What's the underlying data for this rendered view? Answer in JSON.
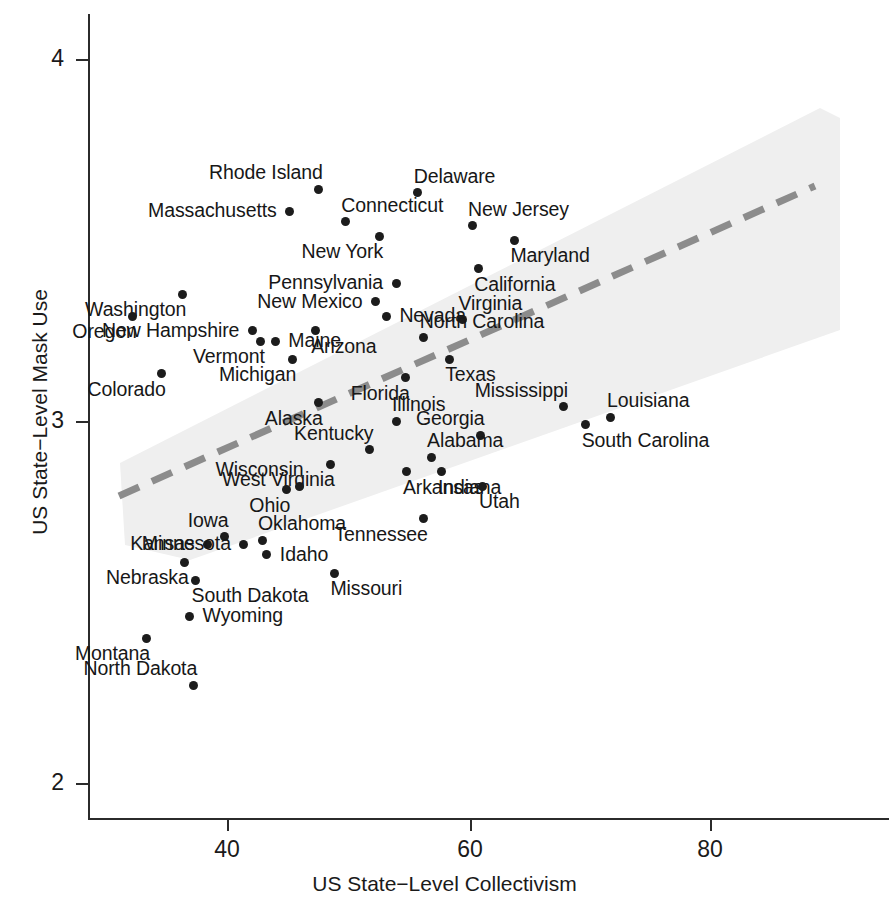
{
  "chart_data": {
    "type": "scatter",
    "title": "",
    "xlabel": "US State−Level Collectivism",
    "ylabel": "US State−Level Mask Use",
    "xlim": [
      30.5,
      91
    ],
    "ylim": [
      2.0,
      4.0
    ],
    "xticks": [
      40,
      60,
      80
    ],
    "xtick_labels": [
      "40",
      "60",
      "80"
    ],
    "yticks": [
      2,
      3,
      4
    ],
    "ytick_labels": [
      "2",
      "3",
      "4"
    ],
    "grid": false,
    "legend": null,
    "point_color": "#1c1c1c",
    "trend_line_color": "#8a8a8a",
    "band_color": "#eeeeee",
    "trend": {
      "type": "linear-fit-dashed",
      "x_start": 33.2,
      "y_start": 2.77,
      "x_end": 88.8,
      "y_end": 3.53,
      "confidence_band": true
    },
    "points": [
      {
        "label": "Rhode Island",
        "x": 47.6,
        "y": 3.64,
        "label_pos": "above-left"
      },
      {
        "label": "Delaware",
        "x": 55.8,
        "y": 3.63,
        "label_pos": "above-right"
      },
      {
        "label": "Massachusetts",
        "x": 45.2,
        "y": 3.58,
        "label_pos": "left"
      },
      {
        "label": "Connecticut",
        "x": 49.8,
        "y": 3.55,
        "label_pos": "above-right"
      },
      {
        "label": "New Jersey",
        "x": 60.3,
        "y": 3.54,
        "label_pos": "above-right"
      },
      {
        "label": "New York",
        "x": 52.6,
        "y": 3.51,
        "label_pos": "below-left"
      },
      {
        "label": "Maryland",
        "x": 63.8,
        "y": 3.5,
        "label_pos": "below-right"
      },
      {
        "label": "California",
        "x": 60.8,
        "y": 3.42,
        "label_pos": "below-right"
      },
      {
        "label": "Pennsylvania",
        "x": 54.0,
        "y": 3.38,
        "label_pos": "left"
      },
      {
        "label": "Washington",
        "x": 36.3,
        "y": 3.35,
        "label_pos": "below-left"
      },
      {
        "label": "New Mexico",
        "x": 52.3,
        "y": 3.33,
        "label_pos": "left"
      },
      {
        "label": "Oregon",
        "x": 32.2,
        "y": 3.29,
        "label_pos": "below-left"
      },
      {
        "label": "Nevada",
        "x": 53.2,
        "y": 3.29,
        "label_pos": "right"
      },
      {
        "label": "Virginia",
        "x": 59.5,
        "y": 3.28,
        "label_pos": "above-right"
      },
      {
        "label": "New Hampshire",
        "x": 42.1,
        "y": 3.25,
        "label_pos": "left"
      },
      {
        "label": "Arizona",
        "x": 47.3,
        "y": 3.25,
        "label_pos": "below-right"
      },
      {
        "label": "North Carolina",
        "x": 56.3,
        "y": 3.23,
        "label_pos": "above-right"
      },
      {
        "label": "Vermont",
        "x": 42.8,
        "y": 3.22,
        "label_pos": "below-left"
      },
      {
        "label": "Maine",
        "x": 44.0,
        "y": 3.22,
        "label_pos": "right"
      },
      {
        "label": "Texas",
        "x": 58.4,
        "y": 3.17,
        "label_pos": "below-right"
      },
      {
        "label": "Michigan",
        "x": 45.4,
        "y": 3.17,
        "label_pos": "below-left"
      },
      {
        "label": "Colorado",
        "x": 34.6,
        "y": 3.13,
        "label_pos": "below-left"
      },
      {
        "label": "Florida",
        "x": 54.8,
        "y": 3.12,
        "label_pos": "below-left"
      },
      {
        "label": "Mississippi",
        "x": 67.9,
        "y": 3.04,
        "label_pos": "above-left"
      },
      {
        "label": "Louisiana",
        "x": 71.8,
        "y": 3.01,
        "label_pos": "above-right"
      },
      {
        "label": "Alaska",
        "x": 47.6,
        "y": 3.05,
        "label_pos": "below-left"
      },
      {
        "label": "Illinois",
        "x": 54.0,
        "y": 3.0,
        "label_pos": "above-right"
      },
      {
        "label": "Georgia",
        "x": 61.0,
        "y": 2.96,
        "label_pos": "above-left"
      },
      {
        "label": "South Carolina",
        "x": 69.7,
        "y": 2.99,
        "label_pos": "below-right"
      },
      {
        "label": "Kentucky",
        "x": 51.8,
        "y": 2.92,
        "label_pos": "above-left"
      },
      {
        "label": "Alabama",
        "x": 56.9,
        "y": 2.9,
        "label_pos": "above-right"
      },
      {
        "label": "West Virginia",
        "x": 48.6,
        "y": 2.88,
        "label_pos": "below-left"
      },
      {
        "label": "Arkansas",
        "x": 54.9,
        "y": 2.86,
        "label_pos": "below-right"
      },
      {
        "label": "Indiana",
        "x": 57.8,
        "y": 2.86,
        "label_pos": "below-right"
      },
      {
        "label": "Wisconsin",
        "x": 46.0,
        "y": 2.82,
        "label_pos": "above-left"
      },
      {
        "label": "Ohio",
        "x": 44.9,
        "y": 2.81,
        "label_pos": "below-left"
      },
      {
        "label": "Utah",
        "x": 61.2,
        "y": 2.82,
        "label_pos": "below-right"
      },
      {
        "label": "Tennessee",
        "x": 56.3,
        "y": 2.73,
        "label_pos": "below-left"
      },
      {
        "label": "Iowa",
        "x": 39.8,
        "y": 2.68,
        "label_pos": "above-left"
      },
      {
        "label": "Oklahoma",
        "x": 42.9,
        "y": 2.67,
        "label_pos": "above-right"
      },
      {
        "label": "Kansas",
        "x": 38.4,
        "y": 2.66,
        "label_pos": "left"
      },
      {
        "label": "Minnesota",
        "x": 41.4,
        "y": 2.66,
        "label_pos": "left"
      },
      {
        "label": "Idaho",
        "x": 43.3,
        "y": 2.63,
        "label_pos": "right"
      },
      {
        "label": "Nebraska",
        "x": 36.5,
        "y": 2.61,
        "label_pos": "below-left"
      },
      {
        "label": "Missouri",
        "x": 48.9,
        "y": 2.58,
        "label_pos": "below-right"
      },
      {
        "label": "South Dakota",
        "x": 37.4,
        "y": 2.56,
        "label_pos": "below-right"
      },
      {
        "label": "Wyoming",
        "x": 36.9,
        "y": 2.46,
        "label_pos": "right"
      },
      {
        "label": "Montana",
        "x": 33.3,
        "y": 2.4,
        "label_pos": "below-left"
      },
      {
        "label": "North Dakota",
        "x": 37.2,
        "y": 2.27,
        "label_pos": "above-left"
      }
    ]
  },
  "axes": {
    "x_title": "US State−Level Collectivism",
    "y_title": "US State−Level Mask Use",
    "x_tick_labels": [
      "40",
      "60",
      "80"
    ],
    "y_tick_labels": [
      "4",
      "3",
      "2"
    ]
  }
}
